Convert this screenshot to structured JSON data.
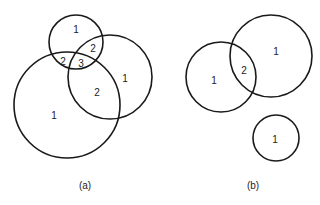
{
  "panels": [
    {
      "caption": "(a)",
      "caption_pos": [
        85,
        185
      ],
      "circles": [
        {
          "cx": 76,
          "cy": 42,
          "r": 27
        },
        {
          "cx": 67,
          "cy": 105,
          "r": 53
        },
        {
          "cx": 110,
          "cy": 77,
          "r": 42
        }
      ],
      "labels": [
        {
          "text": "1",
          "x": 76,
          "y": 29
        },
        {
          "text": "2",
          "x": 93,
          "y": 48
        },
        {
          "text": "2",
          "x": 63,
          "y": 61
        },
        {
          "text": "3",
          "x": 81,
          "y": 63
        },
        {
          "text": "1",
          "x": 125,
          "y": 78
        },
        {
          "text": "2",
          "x": 97,
          "y": 92
        },
        {
          "text": "1",
          "x": 54,
          "y": 115
        }
      ]
    },
    {
      "caption": "(b)",
      "caption_pos": [
        253,
        185
      ],
      "circles": [
        {
          "cx": 221,
          "cy": 77,
          "r": 35
        },
        {
          "cx": 271,
          "cy": 56,
          "r": 41
        },
        {
          "cx": 276,
          "cy": 138,
          "r": 23
        }
      ],
      "labels": [
        {
          "text": "1",
          "x": 214,
          "y": 80
        },
        {
          "text": "2",
          "x": 244,
          "y": 70
        },
        {
          "text": "1",
          "x": 276,
          "y": 51
        },
        {
          "text": "1",
          "x": 275,
          "y": 139
        }
      ]
    }
  ],
  "colors": {
    "stroke": "#1a1a1a",
    "text": "#222222",
    "background": "#ffffff"
  }
}
